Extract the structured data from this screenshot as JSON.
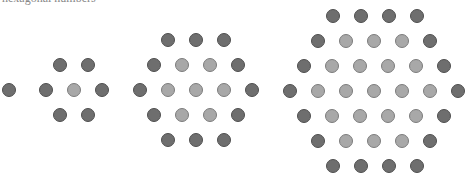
{
  "caption": "hexagonal numbers",
  "colors": {
    "outer": "#6e6e6e",
    "inner": "#a8a8a8"
  },
  "dot_diameter": 14,
  "figures": [
    {
      "name": "hex-1",
      "rows": [
        {
          "y": 90,
          "xs": [
            9
          ],
          "inner": []
        }
      ]
    },
    {
      "name": "hex-7",
      "rows": [
        {
          "y": 65,
          "xs": [
            60,
            88
          ],
          "inner": []
        },
        {
          "y": 90,
          "xs": [
            46,
            74,
            102
          ],
          "inner": [
            1
          ]
        },
        {
          "y": 115,
          "xs": [
            60,
            88
          ],
          "inner": []
        }
      ]
    },
    {
      "name": "hex-19",
      "rows": [
        {
          "y": 40,
          "xs": [
            168,
            196,
            224
          ],
          "inner": []
        },
        {
          "y": 65,
          "xs": [
            154,
            182,
            210,
            238
          ],
          "inner": [
            1,
            2
          ]
        },
        {
          "y": 90,
          "xs": [
            140,
            168,
            196,
            224,
            252
          ],
          "inner": [
            1,
            2,
            3
          ]
        },
        {
          "y": 115,
          "xs": [
            154,
            182,
            210,
            238
          ],
          "inner": [
            1,
            2
          ]
        },
        {
          "y": 140,
          "xs": [
            168,
            196,
            224
          ],
          "inner": []
        }
      ]
    },
    {
      "name": "hex-37",
      "rows": [
        {
          "y": 16,
          "xs": [
            333,
            361,
            389,
            417
          ],
          "inner": []
        },
        {
          "y": 41,
          "xs": [
            318,
            346,
            374,
            402,
            430
          ],
          "inner": [
            1,
            2,
            3
          ]
        },
        {
          "y": 66,
          "xs": [
            304,
            332,
            360,
            388,
            416,
            444
          ],
          "inner": [
            1,
            2,
            3,
            4
          ]
        },
        {
          "y": 91,
          "xs": [
            290,
            318,
            346,
            374,
            402,
            430,
            458
          ],
          "inner": [
            1,
            2,
            3,
            4,
            5
          ]
        },
        {
          "y": 116,
          "xs": [
            304,
            332,
            360,
            388,
            416,
            444
          ],
          "inner": [
            1,
            2,
            3,
            4
          ]
        },
        {
          "y": 141,
          "xs": [
            318,
            346,
            374,
            402,
            430
          ],
          "inner": [
            1,
            2,
            3
          ]
        },
        {
          "y": 166,
          "xs": [
            333,
            361,
            389,
            417
          ],
          "inner": []
        }
      ]
    }
  ]
}
